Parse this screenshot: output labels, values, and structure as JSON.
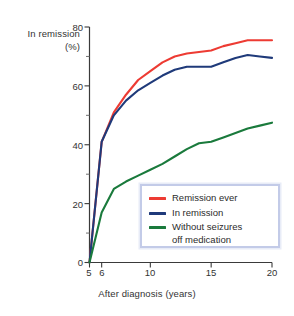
{
  "chart_data": {
    "type": "line",
    "title": "",
    "xlabel": "After diagnosis (years)",
    "ylabel_line1": "In remission",
    "ylabel_line2": "(%)",
    "xlim": [
      5,
      20
    ],
    "ylim": [
      0,
      80
    ],
    "grid": false,
    "legend_position": "inside-bottom-right",
    "x_ticks_major": [
      "5",
      "6",
      "10",
      "15",
      "20"
    ],
    "x_tick_values": [
      5,
      6,
      10,
      15,
      20
    ],
    "y_ticks_major": [
      "0",
      "20",
      "40",
      "60",
      "80"
    ],
    "y_tick_values": [
      0,
      20,
      40,
      60,
      80
    ],
    "y_ticks_minor": [
      10,
      30,
      50,
      70
    ],
    "x": [
      5,
      6,
      7,
      8,
      9,
      10,
      11,
      12,
      13,
      14,
      15,
      16,
      17,
      18,
      19,
      20
    ],
    "series": [
      {
        "name": "Remission ever",
        "color": "#ED3B33",
        "values": [
          0,
          41,
          51,
          57,
          62,
          65,
          68,
          70,
          71,
          71.5,
          72,
          73.5,
          74.5,
          75.5,
          75.5,
          75.5
        ]
      },
      {
        "name": "In remission",
        "color": "#1F3A7A",
        "values": [
          0,
          41,
          50,
          55,
          58.5,
          61,
          63.5,
          65.5,
          66.5,
          66.5,
          66.5,
          68,
          69.5,
          70.5,
          70,
          69.5
        ]
      },
      {
        "name": "Without seizures off medication",
        "name_line1": "Without seizures",
        "name_line2": "off medication",
        "color": "#1A7A3C",
        "values": [
          0,
          17,
          25,
          27.5,
          29.5,
          31.5,
          33.5,
          36,
          38.5,
          40.5,
          41,
          42.5,
          44,
          45.5,
          46.5,
          47.5
        ]
      }
    ]
  },
  "legend": {
    "items": [
      {
        "label": "Remission ever",
        "label2": "",
        "color": "#ED3B33"
      },
      {
        "label": "In remission",
        "label2": "",
        "color": "#1F3A7A"
      },
      {
        "label": "Without seizures",
        "label2": "off medication",
        "color": "#1A7A3C"
      }
    ]
  },
  "colors": {
    "axis": "#3a3a3a",
    "text": "#2b2b2b",
    "legend_border": "#c3cbe8",
    "legend_glow": "#e8ecf7",
    "background": "#ffffff"
  }
}
